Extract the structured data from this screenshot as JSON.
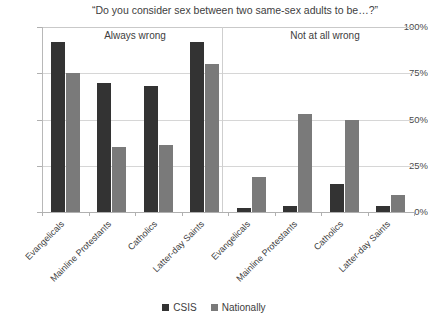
{
  "chart_data": {
    "type": "bar",
    "title": "“Do you consider sex between two same-sex adults to be…?”",
    "xlabel": "",
    "ylabel": "",
    "ylim": [
      0,
      100
    ],
    "ytick_labels": [
      "0%",
      "25%",
      "50%",
      "75%",
      "100%"
    ],
    "ytick_values": [
      0,
      25,
      50,
      75,
      100
    ],
    "grid": true,
    "legend_position": "bottom",
    "panels": [
      {
        "header": "Always wrong",
        "categories": [
          "Evangelicals",
          "Mainline Protestants",
          "Catholics",
          "Latter-day Saints"
        ],
        "series": [
          {
            "name": "CSIS",
            "color": "#333333",
            "values": [
              92,
              70,
              68,
              92
            ]
          },
          {
            "name": "Nationally",
            "color": "#7a7a7a",
            "values": [
              75,
              35,
              36,
              80
            ]
          }
        ]
      },
      {
        "header": "Not at all wrong",
        "categories": [
          "Evangelicals",
          "Mainline Protestants",
          "Catholics",
          "Latter-day Saints"
        ],
        "series": [
          {
            "name": "CSIS",
            "color": "#333333",
            "values": [
              2,
              3,
              15,
              3
            ]
          },
          {
            "name": "Nationally",
            "color": "#7a7a7a",
            "values": [
              19,
              53,
              50,
              9
            ]
          }
        ]
      }
    ],
    "legend": [
      {
        "label": "CSIS",
        "color": "#333333"
      },
      {
        "label": "Nationally",
        "color": "#7a7a7a"
      }
    ]
  }
}
